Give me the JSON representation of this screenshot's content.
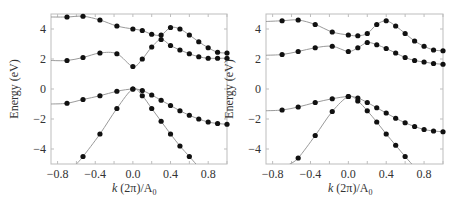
{
  "chart_data": [
    {
      "type": "line",
      "panel": "left",
      "xlabel": "k (2π)/A₀",
      "ylabel": "Energy (eV)",
      "xlim": [
        -0.87,
        1.0
      ],
      "ylim": [
        -5,
        5
      ],
      "xticks": [
        -0.8,
        -0.4,
        0.0,
        0.4,
        0.8
      ],
      "xtick_labels": [
        "−0.8",
        "−0.4",
        "0.0",
        "0.4",
        "0.8"
      ],
      "yticks": [
        4,
        2,
        0,
        -2,
        -4
      ],
      "ytick_labels": [
        "4",
        "2",
        "0",
        "−2",
        "−4"
      ],
      "series": [
        {
          "name": "band-1",
          "x": [
            -0.87,
            -0.7,
            -0.53,
            -0.35,
            -0.17,
            0.0,
            0.1,
            0.2,
            0.3,
            0.4,
            0.5,
            0.6,
            0.7,
            0.8,
            0.9,
            1.0
          ],
          "y": [
            4.8,
            4.8,
            4.85,
            4.6,
            4.2,
            4.0,
            3.9,
            3.65,
            3.6,
            4.1,
            4.0,
            3.6,
            3.15,
            2.75,
            2.45,
            2.4
          ],
          "markers_from": 1
        },
        {
          "name": "band-2",
          "x": [
            -0.87,
            -0.7,
            -0.53,
            -0.35,
            -0.17,
            0.0,
            0.1,
            0.2,
            0.3,
            0.4,
            0.5,
            0.6,
            0.7,
            0.8,
            0.9,
            1.0
          ],
          "y": [
            1.9,
            1.9,
            2.1,
            2.4,
            2.35,
            1.5,
            2.0,
            2.8,
            3.3,
            2.9,
            2.6,
            2.35,
            2.15,
            2.05,
            2.05,
            2.05
          ],
          "markers_from": 1
        },
        {
          "name": "band-3",
          "x": [
            -0.87,
            -0.7,
            -0.53,
            -0.35,
            -0.17,
            0.0,
            0.1,
            0.2,
            0.3,
            0.4,
            0.5,
            0.6,
            0.7,
            0.8,
            0.9,
            1.0
          ],
          "y": [
            -1.0,
            -0.95,
            -0.7,
            -0.45,
            -0.15,
            0.0,
            -0.1,
            -0.4,
            -0.75,
            -1.1,
            -1.45,
            -1.75,
            -2.0,
            -2.2,
            -2.3,
            -2.35
          ],
          "markers_from": 1
        },
        {
          "name": "band-4",
          "x": [
            -0.6,
            -0.53,
            -0.35,
            -0.17,
            0.0,
            0.1,
            0.2,
            0.3,
            0.4,
            0.5,
            0.6,
            0.67
          ],
          "y": [
            -5.0,
            -4.5,
            -3.0,
            -1.3,
            0.0,
            -0.45,
            -1.3,
            -2.15,
            -3.0,
            -3.8,
            -4.5,
            -5.0
          ],
          "markers_from": 1,
          "markers_to": 10
        }
      ]
    },
    {
      "type": "line",
      "panel": "right",
      "xlabel": "k (2π)/A₀",
      "ylabel": "Energy (eV)",
      "xlim": [
        -0.87,
        1.0
      ],
      "ylim": [
        -5,
        5
      ],
      "xticks": [
        -0.8,
        -0.4,
        0.0,
        0.4,
        0.8
      ],
      "xtick_labels": [
        "−0.8",
        "−0.4",
        "0.0",
        "0.4",
        "0.8"
      ],
      "yticks": [
        4,
        2,
        0,
        -2,
        -4
      ],
      "ytick_labels": [
        "4",
        "2",
        "0",
        "−2",
        "−4"
      ],
      "series": [
        {
          "name": "band-1",
          "x": [
            -0.87,
            -0.7,
            -0.53,
            -0.35,
            -0.17,
            0.0,
            0.1,
            0.2,
            0.3,
            0.4,
            0.5,
            0.6,
            0.7,
            0.8,
            0.9,
            1.0
          ],
          "y": [
            4.5,
            4.55,
            4.6,
            4.3,
            3.8,
            3.6,
            3.55,
            3.7,
            4.3,
            4.55,
            4.2,
            3.7,
            3.2,
            2.85,
            2.6,
            2.55
          ],
          "markers_from": 1
        },
        {
          "name": "band-2",
          "x": [
            -0.87,
            -0.7,
            -0.53,
            -0.35,
            -0.17,
            0.0,
            0.1,
            0.2,
            0.3,
            0.4,
            0.5,
            0.6,
            0.7,
            0.8,
            0.9,
            1.0
          ],
          "y": [
            2.25,
            2.3,
            2.5,
            2.75,
            2.85,
            2.5,
            2.75,
            3.1,
            2.95,
            2.7,
            2.4,
            2.1,
            1.9,
            1.8,
            1.7,
            1.65
          ],
          "markers_from": 1
        },
        {
          "name": "band-3",
          "x": [
            -0.87,
            -0.7,
            -0.53,
            -0.35,
            -0.17,
            0.0,
            0.1,
            0.2,
            0.3,
            0.4,
            0.5,
            0.6,
            0.7,
            0.8,
            0.9,
            1.0
          ],
          "y": [
            -1.45,
            -1.4,
            -1.2,
            -0.9,
            -0.65,
            -0.5,
            -0.6,
            -0.9,
            -1.25,
            -1.6,
            -1.95,
            -2.25,
            -2.5,
            -2.7,
            -2.8,
            -2.85
          ],
          "markers_from": 1
        },
        {
          "name": "band-4",
          "x": [
            -0.62,
            -0.53,
            -0.35,
            -0.17,
            0.0,
            0.1,
            0.2,
            0.3,
            0.4,
            0.5,
            0.6,
            0.67
          ],
          "y": [
            -5.0,
            -4.6,
            -3.1,
            -1.5,
            -0.5,
            -0.8,
            -1.45,
            -2.2,
            -3.0,
            -3.75,
            -4.5,
            -5.0
          ],
          "markers_from": 1,
          "markers_to": 10
        }
      ]
    }
  ],
  "panels": [
    {
      "xlabel_k": "k",
      "xlabel_rest": " (2π)/A",
      "xlabel_sub": "0",
      "ylabel": "Energy (eV)"
    },
    {
      "xlabel_k": "k",
      "xlabel_rest": " (2π)/A",
      "xlabel_sub": "0",
      "ylabel": "Energy (eV)"
    }
  ],
  "colors": {
    "line": "#9a9a9a",
    "marker": "#111111",
    "frame": "#bdbdbd",
    "text": "#333333"
  }
}
